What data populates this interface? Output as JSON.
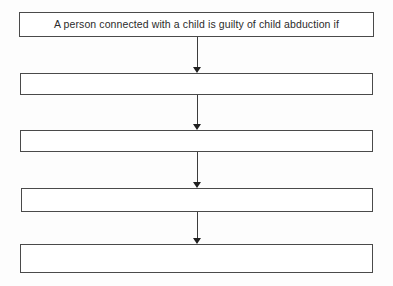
{
  "document": {
    "type": "flowchart",
    "title": "Child abduction flowchart",
    "background_color": "#fdfdfd",
    "box_fill_color": "#ffffff",
    "box_border_color": "#4a4a4a",
    "arrow_color": "#3c3c3c",
    "text_color": "#2b2b2b"
  },
  "nodes": [
    {
      "id": "node-1",
      "label": "A person connected with a child is guilty of child abduction if",
      "empty": false,
      "x": 19,
      "y": 12,
      "width": 355,
      "height": 25
    },
    {
      "id": "node-2",
      "label": "",
      "empty": true,
      "x": 20,
      "y": 73,
      "width": 353,
      "height": 22
    },
    {
      "id": "node-3",
      "label": "",
      "empty": true,
      "x": 20,
      "y": 130,
      "width": 353,
      "height": 22
    },
    {
      "id": "node-4",
      "label": "",
      "empty": true,
      "x": 21,
      "y": 188,
      "width": 352,
      "height": 24
    },
    {
      "id": "node-5",
      "label": "",
      "empty": true,
      "x": 20,
      "y": 244,
      "width": 353,
      "height": 29
    }
  ],
  "connectors": [
    {
      "id": "arrow-1",
      "from": "node-1",
      "to": "node-2",
      "x": 193,
      "y": 37,
      "height": 36
    },
    {
      "id": "arrow-2",
      "from": "node-2",
      "to": "node-3",
      "x": 193,
      "y": 95,
      "height": 35
    },
    {
      "id": "arrow-3",
      "from": "node-3",
      "to": "node-4",
      "x": 193,
      "y": 152,
      "height": 36
    },
    {
      "id": "arrow-4",
      "from": "node-4",
      "to": "node-5",
      "x": 193,
      "y": 212,
      "height": 32
    }
  ]
}
